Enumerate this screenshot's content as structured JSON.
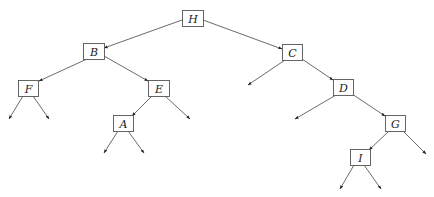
{
  "diagram": {
    "type": "binary-tree",
    "colors": {
      "box_stroke": "#555555",
      "edge": "#444444",
      "text": "#222222",
      "background": "#ffffff"
    },
    "nodes": [
      {
        "id": "H",
        "label": "H",
        "x": 182,
        "y": 10,
        "w": 21,
        "h": 16
      },
      {
        "id": "B",
        "label": "B",
        "x": 83,
        "y": 43,
        "w": 21,
        "h": 16
      },
      {
        "id": "C",
        "label": "C",
        "x": 282,
        "y": 44,
        "w": 20,
        "h": 16
      },
      {
        "id": "F",
        "label": "F",
        "x": 18,
        "y": 80,
        "w": 20,
        "h": 16
      },
      {
        "id": "E",
        "label": "E",
        "x": 148,
        "y": 80,
        "w": 21,
        "h": 16
      },
      {
        "id": "D",
        "label": "D",
        "x": 333,
        "y": 79,
        "w": 20,
        "h": 16
      },
      {
        "id": "A",
        "label": "A",
        "x": 113,
        "y": 115,
        "w": 20,
        "h": 16
      },
      {
        "id": "G",
        "label": "G",
        "x": 385,
        "y": 115,
        "w": 20,
        "h": 16
      },
      {
        "id": "I",
        "label": "I",
        "x": 350,
        "y": 149,
        "w": 20,
        "h": 16
      }
    ],
    "edges": [
      {
        "from": "H",
        "to": "B",
        "x1": 182,
        "y1": 20,
        "x2": 104,
        "y2": 48
      },
      {
        "from": "H",
        "to": "C",
        "x1": 203,
        "y1": 20,
        "x2": 282,
        "y2": 49
      },
      {
        "from": "B",
        "to": "F",
        "x1": 87,
        "y1": 59,
        "x2": 39,
        "y2": 81
      },
      {
        "from": "B",
        "to": "E",
        "x1": 104,
        "y1": 56,
        "x2": 148,
        "y2": 81
      },
      {
        "from": "F",
        "to": "null",
        "x1": 23,
        "y1": 96,
        "x2": 9,
        "y2": 119
      },
      {
        "from": "F",
        "to": "null",
        "x1": 33,
        "y1": 96,
        "x2": 49,
        "y2": 119
      },
      {
        "from": "E",
        "to": "A",
        "x1": 152,
        "y1": 96,
        "x2": 132,
        "y2": 116
      },
      {
        "from": "E",
        "to": "null",
        "x1": 165,
        "y1": 96,
        "x2": 190,
        "y2": 119
      },
      {
        "from": "A",
        "to": "null",
        "x1": 118,
        "y1": 131,
        "x2": 104,
        "y2": 153
      },
      {
        "from": "A",
        "to": "null",
        "x1": 128,
        "y1": 131,
        "x2": 144,
        "y2": 153
      },
      {
        "from": "C",
        "to": "null",
        "x1": 285,
        "y1": 60,
        "x2": 248,
        "y2": 85
      },
      {
        "from": "C",
        "to": "D",
        "x1": 302,
        "y1": 59,
        "x2": 333,
        "y2": 80
      },
      {
        "from": "D",
        "to": "null",
        "x1": 336,
        "y1": 95,
        "x2": 295,
        "y2": 119
      },
      {
        "from": "D",
        "to": "G",
        "x1": 352,
        "y1": 94,
        "x2": 385,
        "y2": 116
      },
      {
        "from": "G",
        "to": "I",
        "x1": 389,
        "y1": 131,
        "x2": 369,
        "y2": 150
      },
      {
        "from": "G",
        "to": "null",
        "x1": 403,
        "y1": 131,
        "x2": 426,
        "y2": 154
      },
      {
        "from": "I",
        "to": "null",
        "x1": 354,
        "y1": 165,
        "x2": 340,
        "y2": 189
      },
      {
        "from": "I",
        "to": "null",
        "x1": 364,
        "y1": 165,
        "x2": 381,
        "y2": 189
      }
    ]
  }
}
